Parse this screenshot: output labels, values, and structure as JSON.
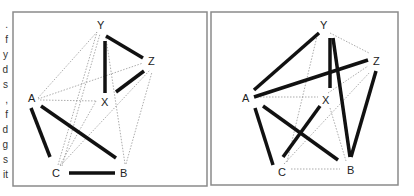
{
  "margin_fragments": [
    ".",
    "f",
    "y",
    "d",
    "s",
    ",",
    "f",
    "d",
    "g",
    "s",
    "it"
  ],
  "colors": {
    "frame": "#8a8a8a",
    "thick": "#111111",
    "dotted": "#888888",
    "label": "#222222"
  },
  "left_graph": {
    "nodes": {
      "Y": {
        "label": "Y",
        "x": 101,
        "y": 25
      },
      "Z": {
        "label": "Z",
        "x": 153,
        "y": 61
      },
      "X": {
        "label": "X",
        "x": 105,
        "y": 102
      },
      "A": {
        "label": "A",
        "x": 32,
        "y": 98
      },
      "C": {
        "label": "C",
        "x": 56,
        "y": 172
      },
      "B": {
        "label": "B",
        "x": 124,
        "y": 172
      }
    },
    "thick_edges": [
      [
        "Y",
        "Z"
      ],
      [
        "Y",
        "X"
      ],
      [
        "Z",
        "X"
      ],
      [
        "A",
        "C"
      ],
      [
        "A",
        "B"
      ],
      [
        "C",
        "B"
      ]
    ],
    "dotted_edges": [
      [
        "A",
        "Y"
      ],
      [
        "A",
        "Z"
      ],
      [
        "A",
        "X"
      ],
      [
        "C",
        "Y"
      ],
      [
        "C",
        "X"
      ],
      [
        "C",
        "Z"
      ],
      [
        "B",
        "Y"
      ],
      [
        "B",
        "Z"
      ],
      [
        "A",
        "X2"
      ]
    ]
  },
  "right_graph": {
    "nodes": {
      "Y": {
        "label": "Y",
        "x": 324,
        "y": 25
      },
      "Z": {
        "label": "Z",
        "x": 377,
        "y": 61
      },
      "X": {
        "label": "X",
        "x": 326,
        "y": 100
      },
      "A": {
        "label": "A",
        "x": 246,
        "y": 98
      },
      "C": {
        "label": "C",
        "x": 282,
        "y": 172
      },
      "B": {
        "label": "B",
        "x": 350,
        "y": 170
      }
    },
    "thick_edges": [
      [
        "A",
        "Y"
      ],
      [
        "A",
        "Z"
      ],
      [
        "Y",
        "X"
      ],
      [
        "Y",
        "B"
      ],
      [
        "Z",
        "B"
      ],
      [
        "A",
        "C"
      ],
      [
        "A",
        "B"
      ],
      [
        "X",
        "C"
      ]
    ],
    "dotted_edges": [
      [
        "A",
        "X"
      ],
      [
        "Y",
        "Z"
      ],
      [
        "Y",
        "C"
      ],
      [
        "Z",
        "X"
      ],
      [
        "Z",
        "C"
      ],
      [
        "X",
        "B"
      ],
      [
        "C",
        "B"
      ]
    ]
  }
}
